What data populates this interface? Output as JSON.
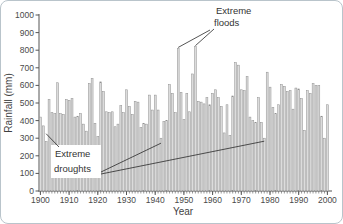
{
  "card": {
    "background": "#ffffff",
    "border_color": "#b9c4cb"
  },
  "chart_data": {
    "type": "bar",
    "title": "",
    "xlabel": "Year",
    "ylabel": "Rainfall (mm)",
    "x_start": 1900,
    "x_step": 1,
    "x_end": 2000,
    "ylim": [
      0,
      1000
    ],
    "grid": false,
    "legend": "none",
    "y_ticks": [
      0,
      100,
      200,
      300,
      400,
      500,
      600,
      700,
      800,
      900,
      1000
    ],
    "x_ticks": [
      1900,
      1910,
      1920,
      1930,
      1940,
      1950,
      1960,
      1970,
      1980,
      1990,
      2000
    ],
    "values": [
      420,
      370,
      280,
      520,
      445,
      440,
      615,
      440,
      435,
      520,
      515,
      525,
      420,
      425,
      440,
      380,
      340,
      610,
      640,
      385,
      310,
      620,
      565,
      450,
      445,
      450,
      365,
      380,
      485,
      445,
      575,
      480,
      435,
      510,
      505,
      360,
      385,
      380,
      545,
      460,
      545,
      460,
      300,
      395,
      400,
      605,
      555,
      445,
      810,
      560,
      405,
      555,
      450,
      665,
      820,
      510,
      505,
      495,
      530,
      490,
      555,
      575,
      530,
      480,
      330,
      490,
      315,
      540,
      730,
      715,
      575,
      570,
      650,
      420,
      400,
      390,
      530,
      390,
      300,
      675,
      590,
      475,
      440,
      490,
      605,
      595,
      565,
      570,
      465,
      585,
      580,
      525,
      345,
      570,
      555,
      610,
      600,
      600,
      425,
      300,
      490
    ],
    "bar_fill": "#dcdcdc",
    "bar_stroke": "#8f8f8f",
    "axis_color": "#555555",
    "annotation_line_color": "#2a2a2a",
    "annotations": [
      {
        "id": "extreme-floods",
        "text_lines": [
          "Extreme",
          "floods"
        ],
        "targets": [
          {
            "year": 1948,
            "value": 810
          },
          {
            "year": 1954,
            "value": 820
          }
        ]
      },
      {
        "id": "extreme-droughts",
        "text_lines": [
          "Extreme",
          "droughts"
        ],
        "targets": [
          {
            "year": 1902,
            "value": 280
          },
          {
            "year": 1942,
            "value": 300
          },
          {
            "year": 1978,
            "value": 300
          }
        ]
      }
    ]
  }
}
